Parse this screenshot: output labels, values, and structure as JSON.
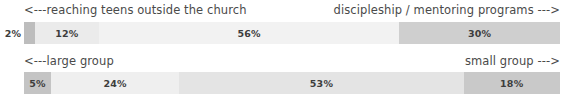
{
  "chart_data": [
    {
      "type": "bar",
      "title": "",
      "subtype": "stacked-horizontal-100",
      "xlabel": "",
      "ylabel": "",
      "xlim": [
        0,
        100
      ],
      "grid": false,
      "legend_position": "none",
      "left_annotation": "<---reaching teens outside the church",
      "right_annotation": "discipleship / mentoring programs --->",
      "categories": [
        "1",
        "2",
        "3",
        "4"
      ],
      "values": [
        2,
        12,
        56,
        30
      ],
      "labels": [
        "2%",
        "12%",
        "56%",
        "30%"
      ],
      "label_placement": [
        "outside-left",
        "inside",
        "inside",
        "inside"
      ],
      "colors": [
        "#bdbdbd",
        "#ebebeb",
        "#f2f2f2",
        "#cfcfcf"
      ]
    },
    {
      "type": "bar",
      "title": "",
      "subtype": "stacked-horizontal-100",
      "xlabel": "",
      "ylabel": "",
      "xlim": [
        0,
        100
      ],
      "grid": false,
      "legend_position": "none",
      "left_annotation": "<---large group",
      "right_annotation": "small group --->",
      "categories": [
        "1",
        "2",
        "3",
        "4"
      ],
      "values": [
        5,
        24,
        53,
        18
      ],
      "labels": [
        "5%",
        "24%",
        "53%",
        "18%"
      ],
      "label_placement": [
        "inside",
        "inside",
        "inside",
        "inside"
      ],
      "colors": [
        "#c4c4c4",
        "#efefef",
        "#e4e4e4",
        "#c9c9c9"
      ]
    }
  ],
  "rows": [
    {
      "left_annotation": "<---reaching teens outside the church",
      "right_annotation": "discipleship / mentoring programs --->",
      "outside_label": "2%",
      "segments": [
        {
          "label": "2%",
          "value": 2,
          "color": "#bdbdbd",
          "show_label": false
        },
        {
          "label": "12%",
          "value": 12,
          "color": "#ebebeb",
          "show_label": true
        },
        {
          "label": "56%",
          "value": 56,
          "color": "#f2f2f2",
          "show_label": true
        },
        {
          "label": "30%",
          "value": 30,
          "color": "#cfcfcf",
          "show_label": true
        }
      ]
    },
    {
      "left_annotation": "<---large group",
      "right_annotation": "small group --->",
      "outside_label": "",
      "segments": [
        {
          "label": "5%",
          "value": 5,
          "color": "#c4c4c4",
          "show_label": true
        },
        {
          "label": "24%",
          "value": 24,
          "color": "#efefef",
          "show_label": true
        },
        {
          "label": "53%",
          "value": 53,
          "color": "#e4e4e4",
          "show_label": true
        },
        {
          "label": "18%",
          "value": 18,
          "color": "#c9c9c9",
          "show_label": true
        }
      ]
    }
  ]
}
